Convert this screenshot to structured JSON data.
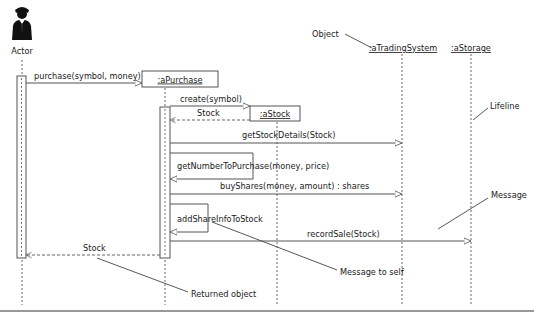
{
  "diagram": {
    "type": "UML sequence diagram",
    "actor": {
      "label": "Actor",
      "icon": "person-in-suit-icon"
    },
    "objects": [
      {
        "id": "aPurchase",
        "label": ":aPurchase"
      },
      {
        "id": "aStock",
        "label": ":aStock"
      },
      {
        "id": "aTradingSystem",
        "label": ":aTradingSystem"
      },
      {
        "id": "aStorage",
        "label": ":aStorage"
      }
    ],
    "messages": [
      {
        "label": "purchase(symbol, money)",
        "from": "Actor",
        "to": "aPurchase",
        "kind": "call"
      },
      {
        "label": "create(symbol)",
        "from": "aPurchase",
        "to": "aStock",
        "kind": "create"
      },
      {
        "label": "Stock",
        "from": "aStock",
        "to": "aPurchase",
        "kind": "return"
      },
      {
        "label": "getStockDetails(Stock)",
        "from": "aPurchase",
        "to": "aTradingSystem",
        "kind": "call"
      },
      {
        "label": "getNumberToPurchase(money, price)",
        "from": "aPurchase",
        "to": "aPurchase",
        "kind": "self"
      },
      {
        "label": "buyShares(money, amount) : shares",
        "from": "aPurchase",
        "to": "aTradingSystem",
        "kind": "call"
      },
      {
        "label": "addShareInfoToStock",
        "from": "aPurchase",
        "to": "aPurchase",
        "kind": "self"
      },
      {
        "label": "recordSale(Stock)",
        "from": "aPurchase",
        "to": "aStorage",
        "kind": "call"
      },
      {
        "label": "Stock",
        "from": "aPurchase",
        "to": "Actor",
        "kind": "return"
      }
    ],
    "annotations": {
      "object": "Object",
      "lifeline": "Lifeline",
      "message": "Message",
      "message_to_self": "Message to self",
      "returned_object": "Returned object"
    },
    "colors": {
      "line": "#555555",
      "text": "#1a1a1a",
      "dashed": "#666666",
      "footer_rule": "#999999"
    }
  }
}
